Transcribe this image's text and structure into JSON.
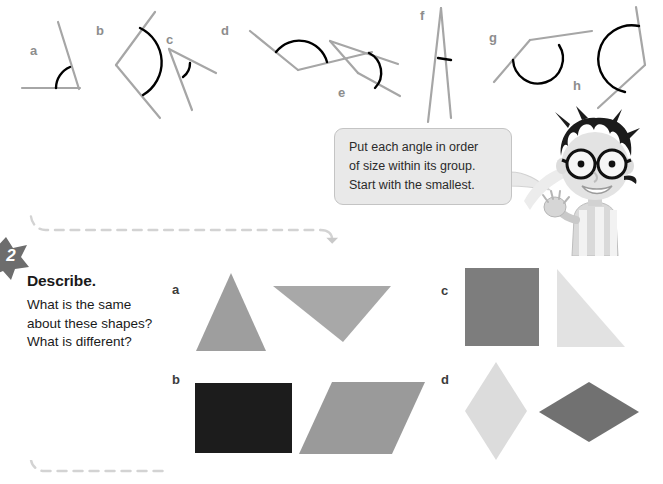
{
  "page": {
    "width": 663,
    "height": 484,
    "background": "#ffffff"
  },
  "angles_exercise": {
    "name": "angles-row",
    "labels": [
      {
        "key": "a",
        "text": "a",
        "x": 30,
        "y": 44
      },
      {
        "key": "b",
        "text": "b",
        "x": 96,
        "y": 24
      },
      {
        "key": "c",
        "text": "c",
        "x": 166,
        "y": 33
      },
      {
        "key": "d",
        "text": "d",
        "x": 221,
        "y": 24
      },
      {
        "key": "e",
        "text": "e",
        "x": 338,
        "y": 86
      },
      {
        "key": "f",
        "text": "f",
        "x": 420,
        "y": 9
      },
      {
        "key": "g",
        "text": "g",
        "x": 489,
        "y": 31
      },
      {
        "key": "h",
        "text": "h",
        "x": 573,
        "y": 79
      }
    ],
    "label_color": "#8d8d8d",
    "ray_color": "#a6a6a6",
    "arc_color": "#000000"
  },
  "speech_bubble": {
    "name": "instruction-bubble",
    "lines": [
      "Put each angle in order",
      "of size within its group.",
      "Start with the smallest."
    ],
    "background": "#e9e9e9",
    "border_color": "#c4c4c4"
  },
  "character": {
    "name": "boy-character",
    "description": "cartoon boy with glasses waving"
  },
  "task": {
    "badge_number": "2",
    "badge_color": "#6d6d6d",
    "heading": "Describe.",
    "body_lines": [
      "What is the same",
      "about these shapes?",
      "What is different?"
    ]
  },
  "shape_rows": [
    {
      "key": "a",
      "label": "a",
      "label_x": 172,
      "label_y": 283,
      "shapes": [
        {
          "name": "triangle-up",
          "type": "triangle",
          "color": "#9e9e9e",
          "x": 196,
          "y": 273,
          "width": 70,
          "height": 78,
          "points": "35,0 70,78 0,78"
        },
        {
          "name": "triangle-down",
          "type": "triangle",
          "color": "#a8a8a8",
          "x": 273,
          "y": 286,
          "width": 118,
          "height": 56,
          "points": "0,0 118,0 70,56"
        }
      ]
    },
    {
      "key": "b",
      "label": "b",
      "label_x": 172,
      "label_y": 373,
      "shapes": [
        {
          "name": "rectangle-dark",
          "type": "rectangle",
          "color": "#1c1c1c",
          "x": 195,
          "y": 383,
          "width": 97,
          "height": 70
        },
        {
          "name": "parallelogram",
          "type": "parallelogram",
          "color": "#9a9a9a",
          "x": 299,
          "y": 382,
          "width": 126,
          "height": 72,
          "points": "33,0 126,0 93,72 0,72"
        }
      ]
    },
    {
      "key": "c",
      "label": "c",
      "label_x": 441,
      "label_y": 284,
      "shapes": [
        {
          "name": "square-dark",
          "type": "square",
          "color": "#7d7d7d",
          "x": 465,
          "y": 268,
          "width": 74,
          "height": 78
        },
        {
          "name": "right-triangle-light",
          "type": "triangle",
          "color": "#e2e2e2",
          "x": 557,
          "y": 269,
          "width": 68,
          "height": 78,
          "points": "0,0 68,78 0,78"
        }
      ]
    },
    {
      "key": "d",
      "label": "d",
      "label_x": 441,
      "label_y": 373,
      "shapes": [
        {
          "name": "rhombus-tall-light",
          "type": "rhombus",
          "color": "#dcdcdc",
          "x": 465,
          "y": 362,
          "width": 62,
          "height": 98,
          "points": "31,0 62,49 31,98 0,49"
        },
        {
          "name": "rhombus-wide-dark",
          "type": "rhombus",
          "color": "#717171",
          "x": 539,
          "y": 382,
          "width": 100,
          "height": 60,
          "points": "50,0 100,30 50,60 0,30"
        }
      ]
    }
  ],
  "dividers": {
    "dash_color": "#d3d3d3",
    "arrow_x": 341,
    "arrow_y": 231
  }
}
